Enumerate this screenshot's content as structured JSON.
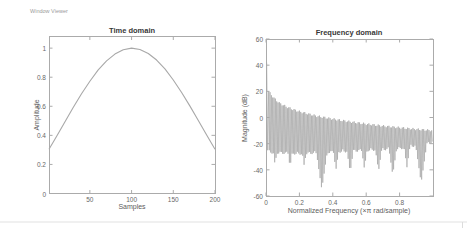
{
  "window_label": "Window Viewer",
  "colors": {
    "line": "#a8a8a8",
    "axis": "#ababab",
    "tick_text": "#686868",
    "title_text": "#373737",
    "background": "#ffffff"
  },
  "charts": {
    "time": {
      "title": "Time domain",
      "xlabel": "Samples",
      "ylabel": "Amplitude",
      "xtick_labels": [
        "50",
        "100",
        "150",
        "200"
      ],
      "ytick_labels": [
        "0",
        "0.2",
        "0.4",
        "0.6",
        "0.8",
        "1"
      ]
    },
    "freq": {
      "title": "Frequency domain",
      "xlabel": "Normalized Frequency  (×π rad/sample)",
      "ylabel": "Magnitude (dB)",
      "xtick_labels": [
        "0",
        "0.2",
        "0.4",
        "0.6",
        "0.8"
      ],
      "ytick_labels": [
        "-60",
        "-40",
        "-20",
        "0",
        "20",
        "40",
        "60"
      ]
    }
  },
  "chart_data": [
    {
      "type": "line",
      "title": "Time domain",
      "xlabel": "Samples",
      "ylabel": "Amplitude",
      "xlim": [
        1,
        200
      ],
      "ylim": [
        0,
        1.08
      ],
      "xticks": [
        50,
        100,
        150,
        200
      ],
      "yticks": [
        0,
        0.2,
        0.4,
        0.6,
        0.8,
        1
      ],
      "grid": false,
      "x": [
        1,
        10,
        20,
        30,
        40,
        50,
        60,
        70,
        80,
        90,
        100,
        110,
        120,
        130,
        140,
        150,
        160,
        170,
        180,
        190,
        200
      ],
      "values": [
        0.304,
        0.392,
        0.492,
        0.591,
        0.686,
        0.772,
        0.85,
        0.912,
        0.959,
        0.989,
        1.0,
        0.991,
        0.963,
        0.918,
        0.857,
        0.781,
        0.695,
        0.601,
        0.502,
        0.402,
        0.304
      ]
    },
    {
      "type": "line",
      "title": "Frequency domain",
      "xlabel": "Normalized Frequency  (×π rad/sample)",
      "ylabel": "Magnitude (dB)",
      "xlim": [
        0,
        1
      ],
      "ylim": [
        -60,
        60
      ],
      "xticks": [
        0,
        0.2,
        0.4,
        0.6,
        0.8
      ],
      "yticks": [
        -60,
        -40,
        -20,
        0,
        20,
        40,
        60
      ],
      "grid": false,
      "mainlobe_peak_db": 42,
      "sidelobe_spacing": 0.008,
      "envelope_top": [
        [
          0.016,
          20
        ],
        [
          0.03,
          17.5
        ],
        [
          0.05,
          14.5
        ],
        [
          0.08,
          11
        ],
        [
          0.12,
          8.3
        ],
        [
          0.16,
          6.2
        ],
        [
          0.2,
          4.5
        ],
        [
          0.25,
          2.8
        ],
        [
          0.3,
          1.2
        ],
        [
          0.35,
          0
        ],
        [
          0.4,
          -1.2
        ],
        [
          0.5,
          -3.2
        ],
        [
          0.6,
          -5.0
        ],
        [
          0.7,
          -6.5
        ],
        [
          0.8,
          -7.8
        ],
        [
          0.9,
          -9.0
        ],
        [
          1.0,
          -10.0
        ]
      ],
      "envelope_bottom": [
        [
          0.016,
          -25
        ],
        [
          0.2,
          -26
        ],
        [
          0.5,
          -24
        ],
        [
          0.8,
          -22
        ],
        [
          1.0,
          -17
        ]
      ],
      "notches": [
        [
          0.05,
          -36
        ],
        [
          0.14,
          -38
        ],
        [
          0.225,
          -37
        ],
        [
          0.33,
          -55
        ],
        [
          0.415,
          -40
        ],
        [
          0.5,
          -42
        ],
        [
          0.585,
          -39
        ],
        [
          0.67,
          -41
        ],
        [
          0.755,
          -44
        ],
        [
          0.84,
          -38
        ],
        [
          0.925,
          -50
        ]
      ]
    }
  ]
}
